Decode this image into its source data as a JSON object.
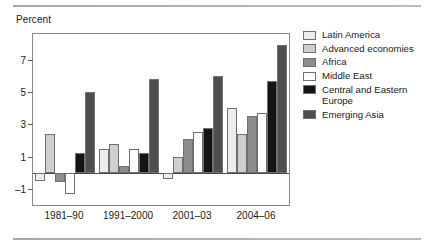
{
  "figure": {
    "axis_title": "Percent",
    "rule_color": "#a9a9ad"
  },
  "chart_data": {
    "type": "bar",
    "title": "",
    "subtitle": "",
    "xlabel": "",
    "ylabel": "Percent",
    "categories": [
      "1981–90",
      "1991–2000",
      "2001–03",
      "2004–06"
    ],
    "yticks": [
      -1,
      1,
      3,
      5,
      7
    ],
    "ytick_labels": [
      "–1",
      "1",
      "3",
      "5",
      "7"
    ],
    "ylim": [
      -2.0,
      8.6
    ],
    "grid": false,
    "legend_position": "right",
    "zero_line": 0,
    "series": [
      {
        "name": "Latin America",
        "color": "#ededed",
        "values": [
          -0.5,
          1.5,
          -0.4,
          4.0
        ]
      },
      {
        "name": "Advanced economies",
        "color": "#cfcfcf",
        "values": [
          2.4,
          1.8,
          1.0,
          2.4
        ]
      },
      {
        "name": "Africa",
        "color": "#8d8d8d",
        "values": [
          -0.6,
          0.4,
          2.1,
          3.5
        ]
      },
      {
        "name": "Middle East",
        "color": "#ffffff",
        "values": [
          -1.3,
          1.5,
          2.5,
          3.7
        ]
      },
      {
        "name": "Central and Eastern Europe",
        "color": "#141414",
        "values": [
          1.2,
          1.2,
          2.8,
          5.7
        ]
      },
      {
        "name": "Emerging Asia",
        "color": "#4f4f4f",
        "values": [
          5.0,
          5.8,
          6.0,
          7.9
        ]
      }
    ]
  }
}
